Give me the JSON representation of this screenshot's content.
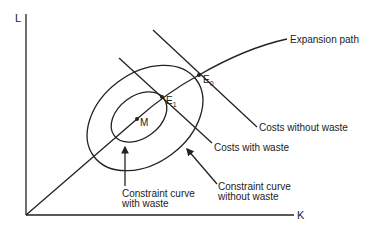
{
  "diagram": {
    "axes": {
      "y_label": "L",
      "x_label": "K"
    },
    "curves": {
      "expansion_path": "Expansion path",
      "costs_without_waste": "Costs without waste",
      "costs_with_waste": "Costs with waste",
      "constraint_with_waste": [
        "Constraint curve",
        "with waste"
      ],
      "constraint_without_waste": [
        "Constraint curve",
        "without waste"
      ]
    },
    "points": {
      "E0": {
        "letter": "E",
        "sub": "0"
      },
      "E1": {
        "letter": "E",
        "sub": "1"
      },
      "M": {
        "letter": "M"
      }
    },
    "colors": {
      "line": "#222222",
      "background": "#ffffff"
    }
  }
}
